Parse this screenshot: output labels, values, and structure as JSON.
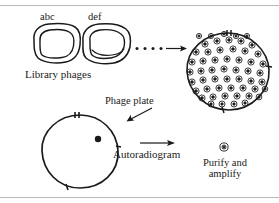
{
  "figure": {
    "labels": {
      "abc": "abc",
      "def": "def",
      "library_phages": "Library phages",
      "phage_plate": "Phage plate",
      "autoradiogram": "Autoradiogram",
      "purify_and_amplify": "Purify and amplify"
    },
    "elements": {
      "plaque_left_name": "library-phage-plaque-abc",
      "plaque_right_name": "library-phage-plaque-def",
      "ellipsis_name": "ellipsis-dots",
      "arrow_to_plate_name": "arrow-to-phage-plate",
      "phage_plate_name": "phage-plate-circle",
      "autoradiogram_name": "autoradiogram-circle",
      "positive_signal_name": "positive-signal-dot",
      "arrow_to_purify_name": "arrow-to-purify",
      "single_plaque_name": "purified-single-plaque"
    },
    "counts": {
      "ellipsis_dots": 4,
      "plate_plaques": 63,
      "autoradiogram_signals": 1,
      "library_plaques": 2
    },
    "colors": {
      "ink": "#1a1a1a",
      "rule": "#b9b9b9",
      "background": "#ffffff"
    }
  }
}
